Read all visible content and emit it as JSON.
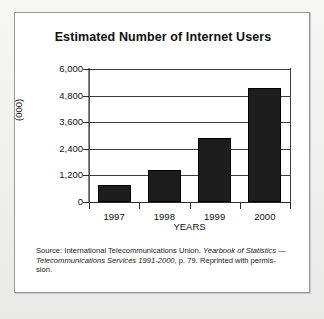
{
  "figure": {
    "frame_border_color": "#9a9a9a",
    "background": "#ffffff",
    "bar_color": "#1d1d1d"
  },
  "source_note": {
    "line1_plain": "Source: International Telecommunications Union, ",
    "line1_italic": "Yearbook of Statistics",
    "line2_dash": "— ",
    "line2_italic": "Telecommunications Services 1991-2000",
    "line2_plain": ", p. 79. Reprinted with permis-",
    "line3_plain": "sion."
  },
  "chart_data": {
    "type": "bar",
    "title": "Estimated Number of Internet Users",
    "xlabel": "YEARS",
    "ylabel": "(000)",
    "categories": [
      "1997",
      "1998",
      "1999",
      "2000"
    ],
    "values": [
      750,
      1450,
      2880,
      5150
    ],
    "ylim": [
      0,
      6000
    ],
    "ytick_values": [
      0,
      1200,
      2400,
      3600,
      4800,
      6000
    ],
    "ytick_labels": [
      "0",
      "1,200",
      "2,400",
      "3,600",
      "4,800",
      "6,000"
    ],
    "grid": true,
    "legend": "none",
    "series": [
      {
        "name": "Internet users (000)",
        "values": [
          750,
          1450,
          2880,
          5150
        ]
      }
    ]
  }
}
